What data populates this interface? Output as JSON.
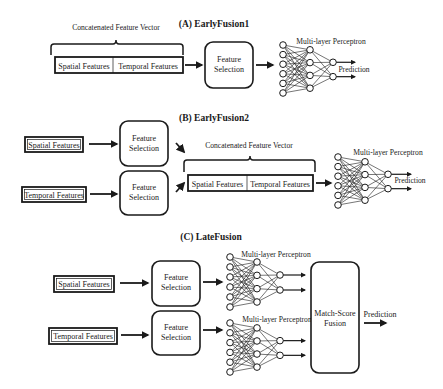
{
  "figure": {
    "background": "#ffffff",
    "ink_color": "#1a1a1a"
  },
  "panels": {
    "a": {
      "title": "(A) EarlyFusion1",
      "concat_label": "Concatenated Feature Vector",
      "concat_segments": [
        "Spatial Features",
        "Temporal Features"
      ],
      "feature_selection": [
        "Feature",
        "Selection"
      ],
      "mlp_label": "Multi-layer Perceptron",
      "output_label": "Prediction"
    },
    "b": {
      "title": "(B) EarlyFusion2",
      "inputs": [
        "Spatial Features",
        "Temporal Features"
      ],
      "feature_selection": [
        "Feature",
        "Selection"
      ],
      "concat_label": "Concatenated Feature Vector",
      "concat_segments": [
        "Spatial Features",
        "Temporal Features"
      ],
      "mlp_label": "Multi-layer Perceptron",
      "output_label": "Prediction"
    },
    "c": {
      "title": "(C) LateFusion",
      "inputs": [
        "Spatial Features",
        "Temporal Features"
      ],
      "feature_selection": [
        "Feature",
        "Selection"
      ],
      "mlp_label": "Multi-layer Perceptron",
      "fusion": [
        "Match-Score",
        "Fusion"
      ],
      "output_label": "Prediction"
    }
  },
  "mlp_structure": {
    "input_nodes": 6,
    "hidden_nodes": 4,
    "output_nodes": 2
  }
}
